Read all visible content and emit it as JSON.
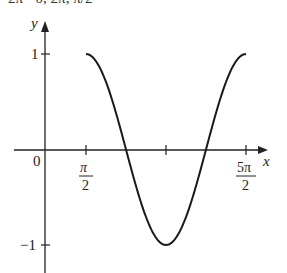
{
  "header": {
    "caption_partial": "2π · 0, 2π, π/2"
  },
  "chart_data": {
    "type": "line",
    "title": "",
    "xlabel": "x",
    "ylabel": "y",
    "function": "y = sin(x)",
    "x_domain": [
      "π/2",
      "5π/2"
    ],
    "x": [
      1.5708,
      1.9635,
      2.3562,
      2.7489,
      3.1416,
      3.5343,
      3.927,
      4.3197,
      4.7124,
      5.1051,
      5.4978,
      5.8905,
      6.2832,
      6.6759,
      7.0686,
      7.4613,
      7.854
    ],
    "values": [
      1,
      0.924,
      0.707,
      0.383,
      0,
      -0.383,
      -0.707,
      -0.924,
      -1,
      -0.924,
      -0.707,
      -0.383,
      0,
      0.383,
      0.707,
      0.924,
      1
    ],
    "xticks": [
      {
        "value": "π/2",
        "num": "π",
        "den": "2"
      },
      {
        "value": "3π/2",
        "num": "",
        "den": ""
      },
      {
        "value": "5π/2",
        "num": "5π",
        "den": "2"
      }
    ],
    "yticks": [
      "1",
      "−1"
    ],
    "origin_label": "0",
    "ylim": [
      -1.2,
      1.35
    ],
    "grid": false,
    "legend": null
  }
}
